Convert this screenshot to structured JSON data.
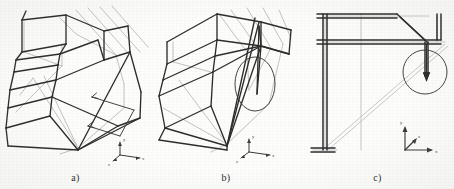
{
  "figure": {
    "background_color": "#fdfdfc",
    "deformed_line_color": "#2a2a2a",
    "undeformed_line_color": "#b9b9b9",
    "annotation_color": "#3a3a3a",
    "panel_count": 3
  },
  "panels": [
    {
      "id": "a",
      "caption": "a)",
      "view": "3d-perspective",
      "description": "Full three-dimensional perspective view of the deformed frame overlaid on the undeformed wireframe",
      "annotations": {
        "arrow_count": 2,
        "arrow_1_label": "",
        "arrow_2_label": "",
        "highlight_shape": "none"
      },
      "axes": {
        "label_x": "x",
        "label_y": "y",
        "label_z": "z",
        "origin_label": ""
      }
    },
    {
      "id": "b",
      "caption": "b)",
      "view": "3d-perspective-rotated",
      "description": "Rotated perspective view with an elliptical callout around the vertical member showing the localized deformation",
      "annotations": {
        "arrow_count": 0,
        "arrow_1_label": "",
        "arrow_2_label": "",
        "highlight_shape": "ellipse"
      },
      "axes": {
        "label_x": "x",
        "label_y": "y",
        "label_z": "z",
        "origin_label": ""
      }
    },
    {
      "id": "c",
      "caption": "c)",
      "view": "2d-projection",
      "description": "Planar projected side view with a circular callout around the displaced joint and its displacement arrow",
      "annotations": {
        "arrow_count": 1,
        "arrow_1_label": "",
        "arrow_2_label": "",
        "highlight_shape": "circle"
      },
      "axes": {
        "label_x": "x",
        "label_y": "y",
        "label_z": "z",
        "origin_label": ""
      }
    }
  ]
}
